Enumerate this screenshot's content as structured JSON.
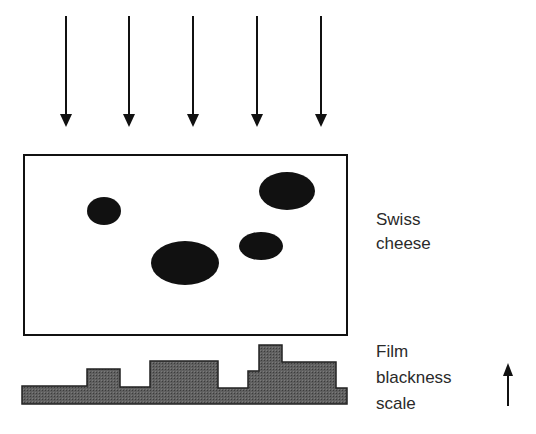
{
  "diagram": {
    "type": "radiography-schematic",
    "colors": {
      "background": "#ffffff",
      "ink": "#111111",
      "histogram_fill": "#5a5a5a",
      "text": "#2a2a2a"
    },
    "incident_rays": {
      "count": 5,
      "x": [
        66,
        129,
        193,
        257,
        321
      ],
      "y_start": 16,
      "y_tip": 127
    },
    "specimen": {
      "x": 24,
      "y": 155,
      "width": 323,
      "height": 180,
      "label_lines": [
        "Swiss",
        "cheese"
      ],
      "holes": [
        {
          "cx": 104,
          "cy": 211,
          "rx": 17,
          "ry": 14
        },
        {
          "cx": 287,
          "cy": 191,
          "rx": 28,
          "ry": 19
        },
        {
          "cx": 261,
          "cy": 246,
          "rx": 22,
          "ry": 14
        },
        {
          "cx": 185,
          "cy": 263,
          "rx": 34,
          "ry": 22
        }
      ]
    },
    "film_profile": {
      "baseline_y": 404,
      "steps": [
        {
          "x0": 22,
          "x1": 87,
          "top": 386
        },
        {
          "x0": 87,
          "x1": 120,
          "top": 369
        },
        {
          "x0": 120,
          "x1": 150,
          "top": 387
        },
        {
          "x0": 150,
          "x1": 218,
          "top": 361
        },
        {
          "x0": 218,
          "x1": 248,
          "top": 388
        },
        {
          "x0": 248,
          "x1": 259,
          "top": 371
        },
        {
          "x0": 259,
          "x1": 282,
          "top": 345
        },
        {
          "x0": 282,
          "x1": 336,
          "top": 362
        },
        {
          "x0": 336,
          "x1": 347,
          "top": 388
        }
      ],
      "label_lines": [
        "Film",
        "blackness",
        "scale"
      ],
      "scale_arrow": {
        "x": 508,
        "y_tail": 406,
        "y_tip": 363,
        "direction": "up"
      }
    }
  }
}
